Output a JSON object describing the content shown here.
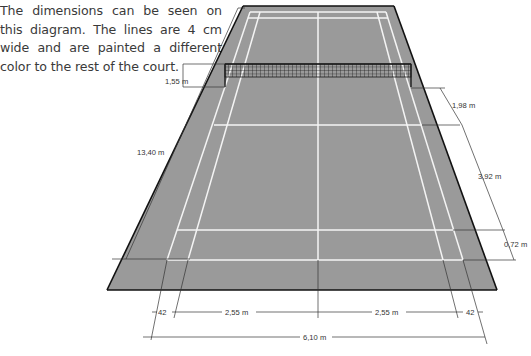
{
  "caption": "The dimensions can be seen on this diagram. The lines are 4 cm wide and are painted a different color to the rest of the court.",
  "diagram": {
    "colors": {
      "court_surface": "#9a9a9a",
      "court_lines": "#f4f4f4",
      "court_edge": "#111111",
      "dimension_lines": "#333333",
      "net": "#1a1a1a"
    },
    "dimensions": {
      "net_height": "1,55 m",
      "court_length": "13,40 m",
      "short_service_distance": "1,98 m",
      "service_length": "3,92 m",
      "back_alley": "0,72 m",
      "side_alley_left": "42",
      "half_width_left": "2,55 m",
      "half_width_right": "2,55 m",
      "side_alley_right": "42",
      "court_width": "6,10 m"
    }
  }
}
